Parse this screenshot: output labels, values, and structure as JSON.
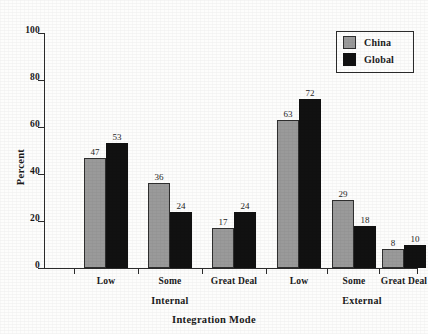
{
  "chart_data": {
    "type": "bar",
    "title": "",
    "xlabel": "Integration Mode",
    "ylabel": "Percent",
    "ylim": [
      0,
      100
    ],
    "yticks": [
      0,
      20,
      40,
      60,
      80,
      100
    ],
    "grid": false,
    "legend_position": "top-right",
    "categories": [
      "Low",
      "Some",
      "Great Deal",
      "Low",
      "Some",
      "Great Deal"
    ],
    "panels": [
      {
        "name": "Internal",
        "categories": [
          "Low",
          "Some",
          "Great Deal"
        ]
      },
      {
        "name": "External",
        "categories": [
          "Low",
          "Some",
          "Great Deal"
        ]
      }
    ],
    "series": [
      {
        "name": "China",
        "color": "#9a9a9a",
        "values": [
          47,
          36,
          17,
          63,
          29,
          8
        ]
      },
      {
        "name": "Global",
        "color": "#111111",
        "values": [
          53,
          24,
          24,
          72,
          18,
          10
        ]
      }
    ]
  },
  "legend": {
    "entries": [
      {
        "label": "China",
        "swatch": "china"
      },
      {
        "label": "Global",
        "swatch": "global"
      }
    ]
  },
  "axes": {
    "y_tick_labels": [
      "0",
      "20",
      "40",
      "60",
      "80",
      "100"
    ],
    "y_axis_title": "Percent",
    "x_axis_title": "Integration Mode",
    "panel_labels": [
      "Internal",
      "External"
    ],
    "category_labels": [
      "Low",
      "Some",
      "Great Deal",
      "Low",
      "Some",
      "Great Deal"
    ]
  },
  "bar_values": [
    "47",
    "53",
    "36",
    "24",
    "17",
    "24",
    "63",
    "72",
    "29",
    "18",
    "8",
    "10"
  ]
}
